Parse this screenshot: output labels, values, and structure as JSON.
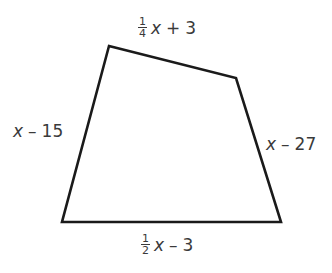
{
  "diagram": {
    "type": "quadrilateral",
    "stroke_color": "#1a1a1a",
    "label_color": "#3a3a3a",
    "vertices": {
      "top_left": [
        109,
        46
      ],
      "top_right": [
        236,
        78
      ],
      "bottom_right": [
        281,
        222
      ],
      "bottom_left": [
        62,
        222
      ]
    },
    "sides": {
      "top": {
        "frac_num": "1",
        "frac_den": "4",
        "var": "x",
        "op": "+",
        "const": "3"
      },
      "left": {
        "var": "x",
        "op": "–",
        "const": "15"
      },
      "right": {
        "var": "x",
        "op": "–",
        "const": "27"
      },
      "bottom": {
        "frac_num": "1",
        "frac_den": "2",
        "var": "x",
        "op": "–",
        "const": "3"
      }
    }
  }
}
